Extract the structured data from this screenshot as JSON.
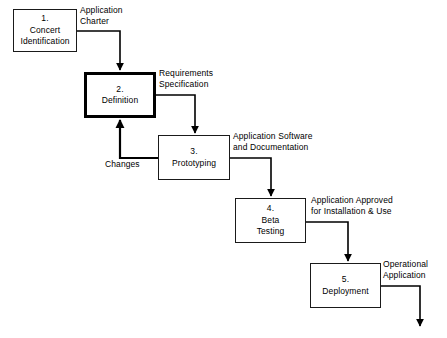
{
  "diagram": {
    "type": "flowchart",
    "background_color": "#ffffff",
    "line_color": "#000000",
    "nodes": [
      {
        "id": "node-1",
        "number": "1.",
        "label": "Concert\nIdentification",
        "emphasis": false,
        "x": 13,
        "y": 9,
        "w": 64,
        "h": 43
      },
      {
        "id": "node-2",
        "number": "2.",
        "label": "Definition",
        "emphasis": true,
        "x": 84,
        "y": 72,
        "w": 72,
        "h": 46
      },
      {
        "id": "node-3",
        "number": "3.",
        "label": "Prototyping",
        "emphasis": false,
        "x": 158,
        "y": 135,
        "w": 72,
        "h": 45
      },
      {
        "id": "node-4",
        "number": "4.",
        "label": "Beta\nTesting",
        "emphasis": false,
        "x": 235,
        "y": 198,
        "w": 71,
        "h": 45
      },
      {
        "id": "node-5",
        "number": "5.",
        "label": "Deployment",
        "emphasis": false,
        "x": 310,
        "y": 263,
        "w": 71,
        "h": 45
      }
    ],
    "edge_labels": [
      {
        "id": "edge-label-application-charter",
        "text": "Application\nCharter",
        "x": 80,
        "y": 5
      },
      {
        "id": "edge-label-requirements-specification",
        "text": "Requirements\nSpecification",
        "x": 159,
        "y": 68
      },
      {
        "id": "edge-label-changes",
        "text": "Changes",
        "x": 105,
        "y": 159
      },
      {
        "id": "edge-label-application-software",
        "text": "Application Software\nand Documentation",
        "x": 233,
        "y": 131
      },
      {
        "id": "edge-label-application-approved",
        "text": "Application Approved\nfor Installation & Use",
        "x": 311,
        "y": 195
      },
      {
        "id": "edge-label-operational-application",
        "text": "Operational\nApplication",
        "x": 383,
        "y": 259
      }
    ],
    "connectors": [
      {
        "id": "connector-1-to-2",
        "from": "node-1",
        "to": "node-2",
        "label": "Application Charter"
      },
      {
        "id": "connector-2-to-3",
        "from": "node-2",
        "to": "node-3",
        "label": "Requirements Specification"
      },
      {
        "id": "connector-3-to-2",
        "from": "node-3",
        "to": "node-2",
        "label": "Changes"
      },
      {
        "id": "connector-3-to-4",
        "from": "node-3",
        "to": "node-4",
        "label": "Application Software and Documentation"
      },
      {
        "id": "connector-4-to-5",
        "from": "node-4",
        "to": "node-5",
        "label": "Application Approved for Installation & Use"
      },
      {
        "id": "connector-5-to-output",
        "from": "node-5",
        "to": "output",
        "label": "Operational Application"
      }
    ]
  }
}
